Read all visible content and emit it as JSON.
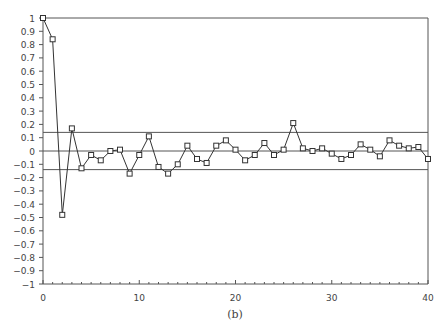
{
  "chart_data": {
    "type": "line",
    "title": "",
    "caption": "(b)",
    "xlabel": "",
    "ylabel": "",
    "xlim": [
      0,
      40
    ],
    "ylim": [
      -1,
      1
    ],
    "x_ticks": [
      0,
      10,
      20,
      30,
      40
    ],
    "y_ticks": [
      1,
      0.9,
      0.8,
      0.7,
      0.6,
      0.5,
      0.4,
      0.3,
      0.2,
      0.1,
      0,
      -0.1,
      -0.2,
      -0.3,
      -0.4,
      -0.5,
      -0.6,
      -0.7,
      -0.8,
      -0.9,
      -1
    ],
    "y_tick_labels": [
      "1",
      "0.9",
      "0.8",
      "0.7",
      "0.6",
      "0.5",
      "0.4",
      "0.3",
      "0.2",
      "0.1",
      "0",
      "−0.1",
      "−0.2",
      "−0.3",
      "−0.4",
      "−0.5",
      "−0.6",
      "−0.7",
      "−0.8",
      "−0.9",
      "−1"
    ],
    "grid": false,
    "legend": null,
    "reference_lines": [
      {
        "name": "upper-confidence-band",
        "y": 0.14
      },
      {
        "name": "zero-line",
        "y": 0
      },
      {
        "name": "lower-confidence-band",
        "y": -0.14
      }
    ],
    "marker": "square",
    "series": [
      {
        "name": "autocorrelation",
        "x": [
          0,
          1,
          2,
          3,
          4,
          5,
          6,
          7,
          8,
          9,
          10,
          11,
          12,
          13,
          14,
          15,
          16,
          17,
          18,
          19,
          20,
          21,
          22,
          23,
          24,
          25,
          26,
          27,
          28,
          29,
          30,
          31,
          32,
          33,
          34,
          35,
          36,
          37,
          38,
          39,
          40
        ],
        "values": [
          1.0,
          0.84,
          -0.48,
          0.17,
          -0.13,
          -0.03,
          -0.07,
          0.0,
          0.01,
          -0.17,
          -0.03,
          0.11,
          -0.12,
          -0.17,
          -0.1,
          0.04,
          -0.06,
          -0.09,
          0.04,
          0.08,
          0.01,
          -0.07,
          -0.03,
          0.06,
          -0.03,
          0.01,
          0.21,
          0.02,
          0.0,
          0.02,
          -0.02,
          -0.06,
          -0.03,
          0.05,
          0.01,
          -0.04,
          0.08,
          0.04,
          0.02,
          0.03,
          -0.06
        ]
      }
    ]
  },
  "colors": {
    "line": "#333333",
    "axis": "#555555",
    "band": "#555555",
    "text": "#444444"
  }
}
